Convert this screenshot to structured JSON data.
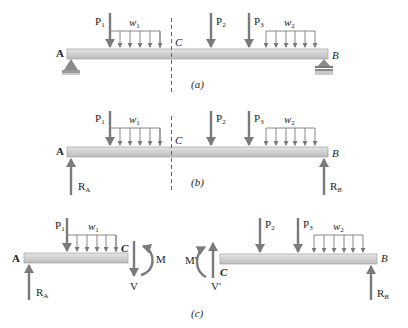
{
  "figure": {
    "panels": [
      {
        "id": "a",
        "caption": "(a)",
        "end_left": "A",
        "end_right": "B",
        "section": "C",
        "loads": {
          "P1": "P",
          "P1_sub": "1",
          "P2": "P",
          "P2_sub": "2",
          "P3": "P",
          "P3_sub": "3",
          "w1": "w",
          "w1_sub": "1",
          "w2": "w",
          "w2_sub": "2"
        },
        "supports": [
          "pin-support-A",
          "roller-support-B"
        ]
      },
      {
        "id": "b",
        "caption": "(b)",
        "end_left": "A",
        "end_right": "B",
        "section": "C",
        "loads": {
          "P1": "P",
          "P1_sub": "1",
          "P2": "P",
          "P2_sub": "2",
          "P3": "P",
          "P3_sub": "3",
          "w1": "w",
          "w1_sub": "1",
          "w2": "w",
          "w2_sub": "2"
        },
        "reactions": {
          "RA": "R",
          "RA_sub": "A",
          "RB": "R",
          "RB_sub": "B"
        }
      },
      {
        "id": "c",
        "caption": "(c)",
        "left_body": {
          "end_left": "A",
          "end_right": "C",
          "loads": {
            "P1": "P",
            "P1_sub": "1",
            "w1": "w",
            "w1_sub": "1"
          },
          "reaction": {
            "RA": "R",
            "RA_sub": "A"
          },
          "shear": "V",
          "moment": "M"
        },
        "right_body": {
          "end_left": "C",
          "end_right": "B",
          "loads": {
            "P2": "P",
            "P2_sub": "2",
            "P3": "P",
            "P3_sub": "3",
            "w2": "w",
            "w2_sub": "2"
          },
          "reaction": {
            "RB": "R",
            "RB_sub": "B"
          },
          "shear": "V'",
          "moment": "M'"
        }
      }
    ],
    "colors": {
      "arrow": "#7a7a7a",
      "beam_fill": "#d6d6d6",
      "beam_stroke": "#9a9a9a",
      "support": "#8a8a8a",
      "text": "#222222"
    }
  }
}
